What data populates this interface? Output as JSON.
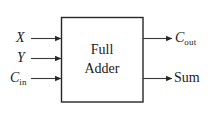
{
  "diagram": {
    "type": "block-diagram",
    "background_color": "#ffffff",
    "line_color": "#262626",
    "block": {
      "name": "full-adder-block",
      "line1": "Full",
      "line2": "Adder",
      "border_color": "#262626",
      "fill_color": "#ffffff"
    },
    "inputs": [
      {
        "name": "input-x",
        "label": "X",
        "subscript": "",
        "italic": true
      },
      {
        "name": "input-y",
        "label": "Y",
        "subscript": "",
        "italic": true
      },
      {
        "name": "input-cin",
        "label": "C",
        "subscript": "in",
        "italic": true
      }
    ],
    "outputs": [
      {
        "name": "output-cout",
        "label": "C",
        "subscript": "out",
        "italic": true
      },
      {
        "name": "output-sum",
        "label": "Sum",
        "subscript": "",
        "italic": false
      }
    ]
  }
}
